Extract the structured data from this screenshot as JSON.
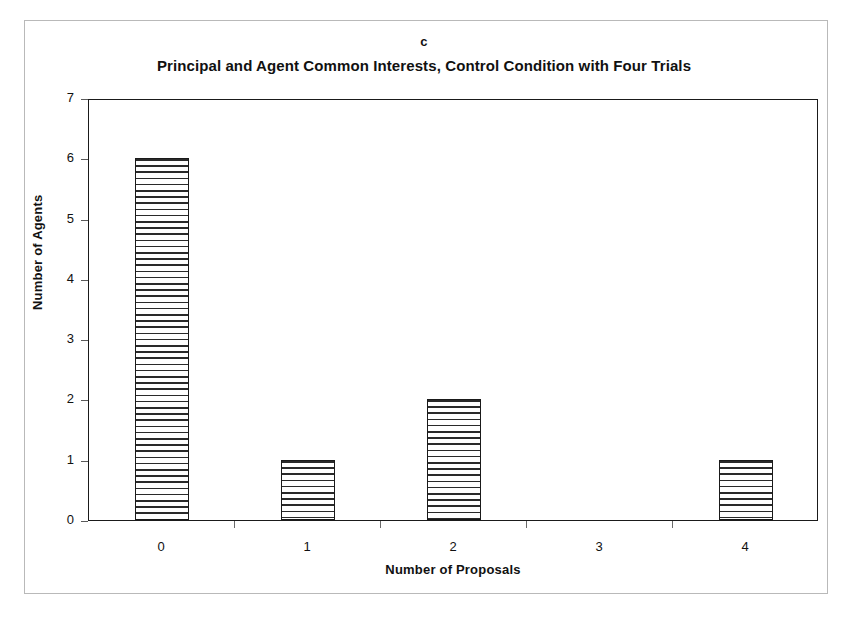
{
  "panel": {
    "label": "c"
  },
  "chart_data": {
    "type": "bar",
    "title": "Principal and Agent Common Interests, Control Condition with Four Trials",
    "xlabel": "Number of Proposals",
    "ylabel": "Number of Agents",
    "categories": [
      "0",
      "1",
      "2",
      "3",
      "4"
    ],
    "values": [
      6,
      1,
      2,
      0,
      1
    ],
    "ylim": [
      0,
      7
    ],
    "ytick_labels": [
      "0",
      "1",
      "2",
      "3",
      "4",
      "5",
      "6",
      "7"
    ],
    "ytick_values": [
      0,
      1,
      2,
      3,
      4,
      5,
      6,
      7
    ],
    "grid": false,
    "legend": false,
    "bar_fill": "horizontal-line-hatch",
    "bar_edge_color": "#1a1a1a",
    "bar_face_color": "#ffffff",
    "axis_color": "#1a1a1a",
    "background_color": "#ffffff"
  }
}
